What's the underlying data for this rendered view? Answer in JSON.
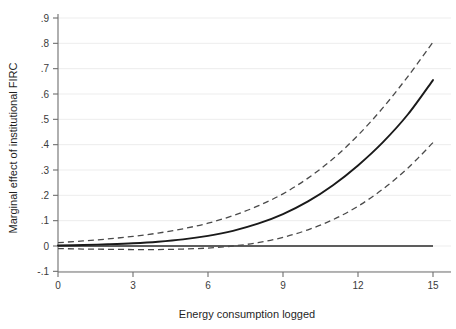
{
  "chart_data": {
    "type": "line",
    "title": "",
    "xlabel": "Energy consumption logged",
    "ylabel": "Marginal effect of institutional FIRC",
    "xlim": [
      -0.35,
      15.6
    ],
    "ylim": [
      -0.115,
      0.93
    ],
    "xticks": [
      0,
      3,
      6,
      9,
      12,
      15
    ],
    "xtick_labels": [
      "0",
      "3",
      "6",
      "9",
      "12",
      "15"
    ],
    "yticks": [
      -0.1,
      0,
      0.1,
      0.2,
      0.3,
      0.4,
      0.5,
      0.6,
      0.7,
      0.8,
      0.9
    ],
    "ytick_labels": [
      "-.1",
      "0",
      ".1",
      ".2",
      ".3",
      ".4",
      ".5",
      ".6",
      ".7",
      ".8",
      ".9"
    ],
    "grid": "horizontal",
    "legend": "none",
    "x": [
      0,
      1,
      2,
      3,
      4,
      5,
      6,
      7,
      8,
      9,
      10,
      11,
      12,
      13,
      14,
      15
    ],
    "series": [
      {
        "name": "Marginal effect",
        "style": "solid",
        "color": "#1a1a1a",
        "values": [
          0.002,
          0.004,
          0.007,
          0.011,
          0.017,
          0.026,
          0.04,
          0.06,
          0.088,
          0.126,
          0.176,
          0.24,
          0.318,
          0.41,
          0.52,
          0.655
        ]
      },
      {
        "name": "Upper 95% confidence bound",
        "style": "dashed",
        "color": "#4a4a4a",
        "values": [
          0.013,
          0.02,
          0.028,
          0.038,
          0.051,
          0.068,
          0.09,
          0.12,
          0.158,
          0.206,
          0.268,
          0.344,
          0.437,
          0.546,
          0.67,
          0.805
        ]
      },
      {
        "name": "Lower 95% confidence bound",
        "style": "dashed",
        "color": "#4a4a4a",
        "values": [
          -0.01,
          -0.012,
          -0.013,
          -0.014,
          -0.014,
          -0.012,
          -0.008,
          0.0,
          0.013,
          0.034,
          0.064,
          0.104,
          0.157,
          0.225,
          0.308,
          0.408
        ]
      },
      {
        "name": "Zero reference line",
        "style": "solid-reference",
        "color": "#2a2a2a",
        "values": [
          0,
          0,
          0,
          0,
          0,
          0,
          0,
          0,
          0,
          0,
          0,
          0,
          0,
          0,
          0,
          0
        ]
      }
    ]
  }
}
